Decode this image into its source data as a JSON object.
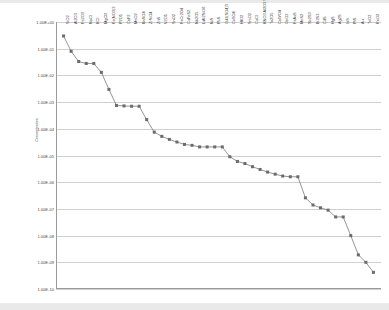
{
  "chart_data": {
    "type": "line",
    "title": "",
    "xlabel": "",
    "ylabel": "Concentration",
    "yscale": "log",
    "ylim": [
      1e-10,
      1
    ],
    "grid": true,
    "legend": false,
    "ytick_labels": [
      "1.00E+00",
      "1.00E-01",
      "1.00E-02",
      "1.00E-03",
      "1.00E-04",
      "1.00E-05",
      "1.00E-06",
      "1.00E-07",
      "1.00E-08",
      "1.00E-09",
      "1.00E-10"
    ],
    "ytick_values": [
      1,
      0.1,
      0.01,
      0.001,
      0.0001,
      1e-05,
      1e-06,
      1e-07,
      1e-08,
      1e-09,
      1e-10
    ],
    "categories": [
      "SiO2",
      "Al2O3",
      "Fe2O3",
      "NaCl",
      "KCl",
      "MgCl2",
      "Fe(NO3)3",
      "P2O5",
      "CaF2",
      "MnO2",
      "BaSO4",
      "ZrSiO4",
      "ZnS",
      "V2O5",
      "SnO2",
      "FeCr2O4",
      "CuFeS2",
      "Nb2O5",
      "LiAl2SiO6",
      "NiS",
      "PbS",
      "Gd2(SO4)3",
      "CoSO4",
      "HfO2",
      "SmO2",
      "CuCl",
      "KNO3 Al2O3 SiO2",
      "Ta2O5",
      "CaWO4",
      "GeO2",
      "FeAsS",
      "MoS2",
      "Sb2S3",
      "Bi2S3",
      "CdS",
      "HgS",
      "Ag2S",
      "InS",
      "PtS",
      "Au",
      "TeO2",
      "ReO2"
    ],
    "values": [
      0.3,
      0.08,
      0.033,
      0.028,
      0.028,
      0.013,
      0.003,
      0.00075,
      0.00072,
      0.0007,
      0.0007,
      0.00022,
      7.5e-05,
      5.2e-05,
      4e-05,
      3.2e-05,
      2.6e-05,
      2.4e-05,
      2.1e-05,
      2.1e-05,
      2.1e-05,
      2.1e-05,
      9e-06,
      6e-06,
      5e-06,
      3.8e-06,
      3e-06,
      2.4e-06,
      2e-06,
      1.7e-06,
      1.6e-06,
      1.6e-06,
      2.6e-07,
      1.4e-07,
      1.1e-07,
      9e-08,
      5e-08,
      5e-08,
      1e-08,
      1.9e-09,
      1e-09,
      4.2e-10
    ]
  }
}
